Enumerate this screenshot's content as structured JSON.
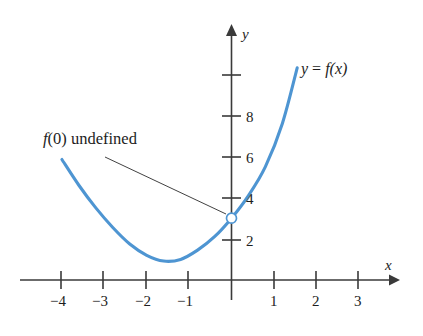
{
  "chart_data": {
    "type": "line",
    "title": "",
    "xlabel": "x",
    "ylabel": "y",
    "grid": false,
    "legend": "none",
    "xlim": [
      -4.95,
      3.85
    ],
    "ylim": [
      -0.45,
      11.2
    ],
    "x_ticks": [
      -4,
      -3,
      -2,
      -1,
      1,
      2,
      3
    ],
    "x_tick_labels": [
      "−4",
      "−3",
      "−2",
      "−1",
      "1",
      "2",
      "3"
    ],
    "y_ticks": [
      2,
      4,
      6,
      8,
      10
    ],
    "y_tick_labels": [
      "2",
      "4",
      "6",
      "8",
      ""
    ],
    "series": [
      {
        "name": "y = f(x)",
        "color": "#4e95d2",
        "linewidth": 3.1,
        "x": [
          -4.0,
          -3.6,
          -3.2,
          -2.8,
          -2.4,
          -2.0,
          -1.6,
          -1.2,
          -0.8,
          -0.4,
          0.0,
          0.4,
          0.8,
          1.2,
          1.55
        ],
        "y": [
          5.85,
          4.6,
          3.5,
          2.55,
          1.75,
          1.2,
          0.92,
          1.0,
          1.45,
          2.1,
          3.0,
          4.1,
          5.5,
          7.6,
          10.3
        ]
      }
    ],
    "markers": [
      {
        "type": "open-circle",
        "x": 0,
        "y": 3,
        "radius": 5,
        "edge_color": "#4e95d2",
        "face_color": "#ffffff",
        "label": "f(0) undefined"
      }
    ],
    "annotations": [
      {
        "name": "undefined-note",
        "text_plain": "f(0) undefined",
        "text_italic_part": "f",
        "text_rest": "(0) undefined",
        "points_to": [
          0,
          3
        ]
      },
      {
        "name": "curve-equation",
        "text": "y = f(x)"
      }
    ]
  },
  "labels": {
    "x_axis_name": "x",
    "y_axis_name": "y",
    "curve_equation_y": "y",
    "curve_equation_eq": "=",
    "curve_equation_f": "f",
    "curve_equation_arg": "(x)",
    "annotation_f": "f",
    "annotation_rest": "(0) undefined",
    "x_tick_neg4": "−4",
    "x_tick_neg3": "−3",
    "x_tick_neg2": "−2",
    "x_tick_neg1": "−1",
    "x_tick_1": "1",
    "x_tick_2": "2",
    "x_tick_3": "3",
    "y_tick_2": "2",
    "y_tick_4": "4",
    "y_tick_6": "6",
    "y_tick_8": "8"
  },
  "colors": {
    "curve": "#4e95d2",
    "axis": "#3a3a3a",
    "text": "#1d1d1d",
    "background": "#ffffff",
    "leader": "#2b2b2b"
  }
}
